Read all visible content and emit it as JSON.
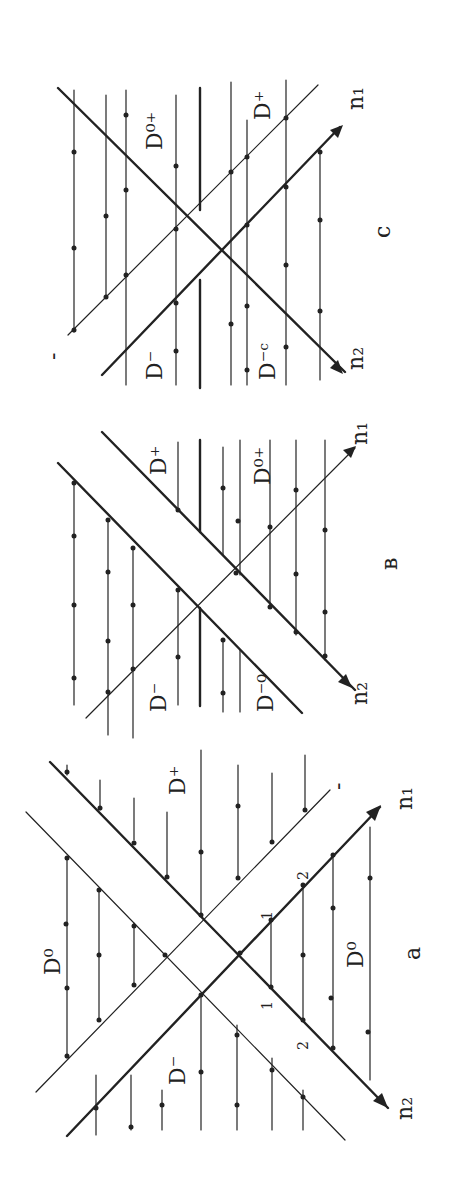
{
  "figure": {
    "orientation": "rotated 90 degrees counter-clockwise",
    "panels": [
      {
        "id": "c",
        "label": "c",
        "axes": {
          "n1": "n₁",
          "n2": "n₂"
        },
        "regions": [
          "D⁰⁺",
          "D⁺",
          "D⁻",
          "D⁻ᶜ"
        ],
        "minus_mark": "-"
      },
      {
        "id": "b",
        "label": "в",
        "axes": {
          "n1": "n₁",
          "n2": "n₂"
        },
        "regions": [
          "D⁺",
          "D⁰⁺",
          "D⁻",
          "D⁻⁰"
        ]
      },
      {
        "id": "a",
        "label": "a",
        "axes": {
          "n1": "n₁",
          "n2": "n₂"
        },
        "regions": [
          "D⁰",
          "D⁺",
          "D⁻",
          "D⁰"
        ],
        "ticks": [
          "1",
          "2",
          "1",
          "2"
        ],
        "minus_mark": "-"
      }
    ]
  }
}
